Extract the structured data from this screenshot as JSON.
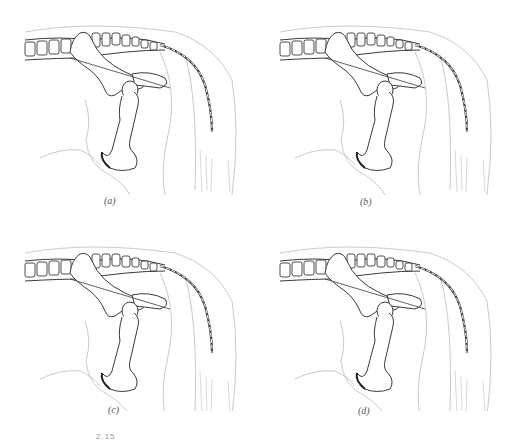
{
  "figure": {
    "number_fragment": "2.15",
    "panels": [
      {
        "id": "a",
        "label": "(a)"
      },
      {
        "id": "b",
        "label": "(b)"
      },
      {
        "id": "c",
        "label": "(c)"
      },
      {
        "id": "d",
        "label": "(d)"
      }
    ],
    "colors": {
      "bone_stroke": "#3a3a3a",
      "outline_stroke": "#bdbdbd",
      "background": "#ffffff"
    }
  }
}
